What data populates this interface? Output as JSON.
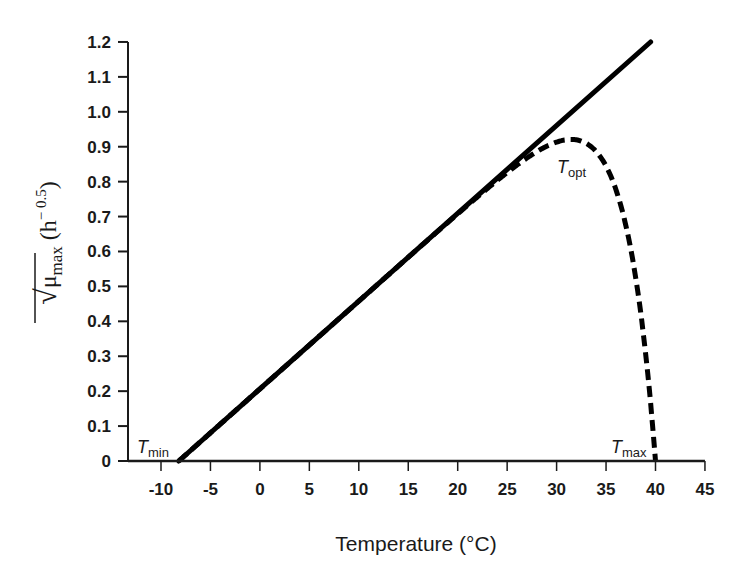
{
  "chart_data": {
    "type": "line",
    "title": "",
    "xlabel": "Temperature (°C)",
    "ylabel": {
      "prefix": "√",
      "symbol": "μ",
      "subscript": "max",
      "unit_open": " (h",
      "unit_exp": "− 0.5",
      "unit_close": ")"
    },
    "xlim": [
      -13.2,
      45
    ],
    "ylim": [
      0,
      1.2
    ],
    "x_ticks": [
      -10,
      -5,
      0,
      5,
      10,
      15,
      20,
      25,
      30,
      35,
      40,
      45
    ],
    "y_ticks": [
      {
        "value": 0,
        "label": "0"
      },
      {
        "value": 0.1,
        "label": "0.1"
      },
      {
        "value": 0.2,
        "label": "0.2"
      },
      {
        "value": 0.3,
        "label": "0.3"
      },
      {
        "value": 0.4,
        "label": "0.4"
      },
      {
        "value": 0.5,
        "label": "0.5"
      },
      {
        "value": 0.6,
        "label": "0.6"
      },
      {
        "value": 0.7,
        "label": "0.7"
      },
      {
        "value": 0.8,
        "label": "0.8"
      },
      {
        "value": 0.9,
        "label": "0.9"
      },
      {
        "value": 1.0,
        "label": "1.0"
      },
      {
        "value": 1.1,
        "label": "1.1"
      },
      {
        "value": 1.2,
        "label": "1.2"
      }
    ],
    "grid": false,
    "legend": null,
    "series": [
      {
        "name": "Linear square-root model",
        "style": "solid",
        "x": [
          -8.2,
          39.5
        ],
        "y": [
          0,
          1.2
        ]
      },
      {
        "name": "Extended model (with Tmax)",
        "style": "dashed",
        "model": {
          "Tmin": -8.2,
          "Tmax": 40,
          "b": 0.02516,
          "c": 0.3
        },
        "x": [
          -8.2,
          0,
          10,
          20,
          25,
          28,
          30,
          31,
          32,
          33,
          34,
          35,
          36,
          37,
          38,
          39,
          39.5,
          40
        ],
        "y": [
          0,
          0.206,
          0.458,
          0.707,
          0.822,
          0.875,
          0.906,
          0.915,
          0.916,
          0.906,
          0.882,
          0.839,
          0.769,
          0.661,
          0.509,
          0.304,
          0.17,
          0
        ]
      }
    ],
    "annotations": [
      {
        "text": "T",
        "sub": "min",
        "x": -8.2,
        "y": 0,
        "position": "left"
      },
      {
        "text": "T",
        "sub": "opt",
        "x": 31,
        "y": 0.92,
        "position": "below"
      },
      {
        "text": "T",
        "sub": "max",
        "x": 40,
        "y": 0,
        "position": "left"
      }
    ],
    "colors": {
      "line": "#000000",
      "axis": "#1a1a1a",
      "text": "#1a1a1a"
    }
  }
}
